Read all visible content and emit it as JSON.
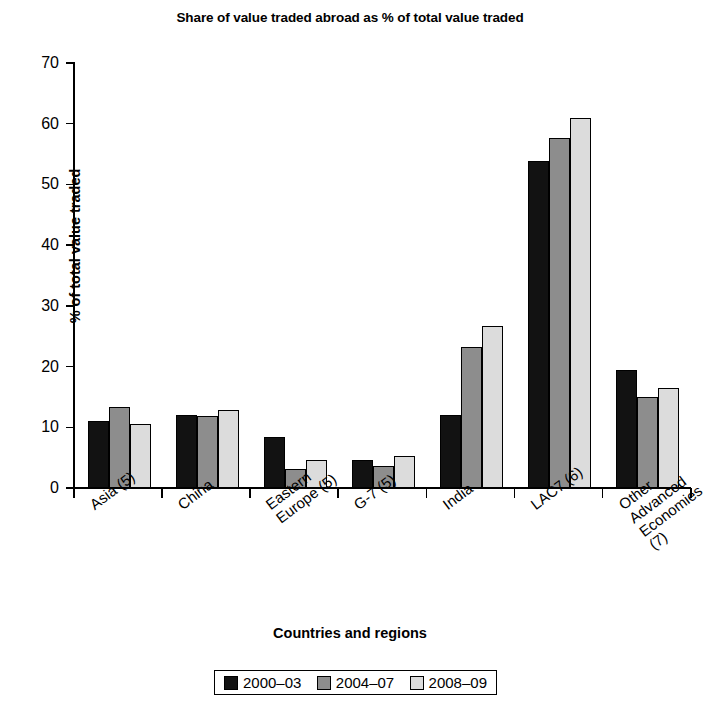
{
  "chart_data": {
    "type": "bar",
    "title": "Share of value traded abroad as % of total value traded",
    "xlabel": "Countries and regions",
    "ylabel": "% of total value traded",
    "ylim": [
      0,
      70
    ],
    "yticks": [
      0,
      10,
      20,
      30,
      40,
      50,
      60,
      70
    ],
    "grid": false,
    "legend_position": "bottom",
    "categories": [
      "Asia (5)",
      "China",
      "Eastern\nEurope (5)",
      "G-7 (5)",
      "India",
      "LAC7 (6)",
      "Other Advanced\nEconomies (7)"
    ],
    "series": [
      {
        "name": "2000–03",
        "color": "#121212",
        "values": [
          11.0,
          12.0,
          8.4,
          4.6,
          12.0,
          53.8,
          19.4
        ]
      },
      {
        "name": "2004–07",
        "color": "#8d8d8d",
        "values": [
          13.4,
          11.8,
          3.1,
          3.6,
          23.2,
          57.7,
          15.0
        ]
      },
      {
        "name": "2008–09",
        "color": "#dcdcdc",
        "values": [
          10.5,
          12.8,
          4.6,
          5.3,
          26.7,
          61.0,
          16.4
        ]
      }
    ]
  }
}
